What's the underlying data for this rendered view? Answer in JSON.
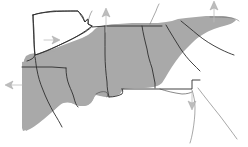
{
  "figure": {
    "kind": "map",
    "width": 248,
    "height": 147,
    "background_color": "#ffffff"
  },
  "colors": {
    "shaded_region_fill": "#a9a9a9",
    "unshaded_region_fill": "#ffffff",
    "state_border": "#2e2e2e",
    "interior_border": "#4a4a4a",
    "coast_line": "#6d6d6d",
    "marker_fill": "#bdbdbd",
    "marker_stroke": "#9a9a9a"
  },
  "legend": {
    "shaded_label": "Shaded region",
    "unshaded_label": "Unshaded region",
    "marker_label": "Direction marker"
  },
  "regions": [
    {
      "id": "region-northwest-unshaded",
      "label": "Arkansas",
      "fill": "unshaded",
      "position": "upper-left"
    },
    {
      "id": "region-west-shaded",
      "label": "East Texas",
      "fill": "shaded",
      "position": "left"
    },
    {
      "id": "region-louisiana",
      "label": "Louisiana",
      "fill": "shaded",
      "position": "lower-left"
    },
    {
      "id": "region-mississippi",
      "label": "Mississippi",
      "fill": "shaded",
      "position": "lower-center-left"
    },
    {
      "id": "region-tennessee",
      "label": "Tennessee",
      "fill": "shaded",
      "position": "upper-center"
    },
    {
      "id": "region-alabama",
      "label": "Alabama",
      "fill": "shaded",
      "position": "center"
    },
    {
      "id": "region-georgia",
      "label": "Georgia",
      "fill": "shaded",
      "position": "center-right"
    },
    {
      "id": "region-south-carolina",
      "label": "South Carolina",
      "fill": "shaded",
      "position": "right"
    },
    {
      "id": "region-north-carolina",
      "label": "North Carolina",
      "fill": "shaded",
      "position": "upper-right"
    },
    {
      "id": "region-florida-panhandle",
      "label": "Florida panhandle",
      "fill": "shaded",
      "position": "lower-right"
    }
  ],
  "markers": [
    {
      "id": "marker-1",
      "direction": "up",
      "x": 106,
      "y": 22,
      "note": "northern boundary, center-left"
    },
    {
      "id": "marker-2",
      "direction": "up",
      "x": 214,
      "y": 12,
      "note": "northeastern boundary"
    },
    {
      "id": "marker-3",
      "direction": "right",
      "x": 52,
      "y": 40,
      "note": "inside unshaded northwest region"
    },
    {
      "id": "marker-4",
      "direction": "left",
      "x": 14,
      "y": 85,
      "note": "western boundary"
    },
    {
      "id": "marker-5",
      "direction": "down",
      "x": 192,
      "y": 104,
      "note": "southern coastal boundary"
    }
  ]
}
